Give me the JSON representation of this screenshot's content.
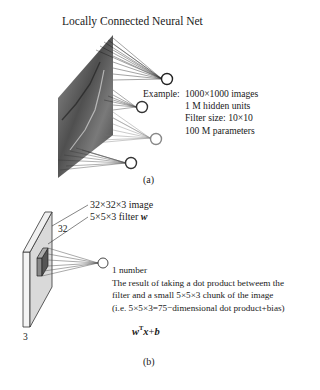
{
  "panel_a": {
    "title": "Locally Connected Neural Net",
    "example_label": "Example:",
    "example_lines": [
      "1000×1000 images",
      "1 M hidden units",
      "Filter size: 10×10",
      "100 M parameters"
    ],
    "caption": "(a)",
    "hidden_unit_icon": "circle-node-icon"
  },
  "panel_b": {
    "image_label": "32×32×3 image",
    "filter_label": "5×5×3 filter",
    "filter_symbol": "w",
    "dim_width": "32",
    "dim_depth": "3",
    "output_lines": [
      "1 number",
      "The result of taking a dot product betweem the",
      "filter and a small 5×5×3 chunk of the image",
      "(i.e. 5×5×3=75−dimensional dot product+bias)"
    ],
    "formula": {
      "w": "w",
      "sup": "T",
      "x": "x",
      "plus": "+",
      "b": "b"
    },
    "caption": "(b)"
  }
}
